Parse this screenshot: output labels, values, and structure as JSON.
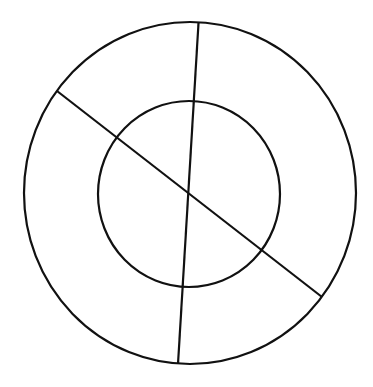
{
  "diagram": {
    "background": "#ffffff",
    "stroke_color": "#111111",
    "stroke_width": 2.2,
    "outer_circle": {
      "cx": 190,
      "cy": 193,
      "rx": 166,
      "ry": 171
    },
    "inner_circle": {
      "cx": 189,
      "cy": 194,
      "rx": 91,
      "ry": 93
    },
    "lines": [
      {
        "x1": 198.5,
        "y1": 23,
        "x2": 178,
        "y2": 364
      },
      {
        "x1": 57,
        "y1": 91,
        "x2": 322,
        "y2": 297
      }
    ]
  }
}
